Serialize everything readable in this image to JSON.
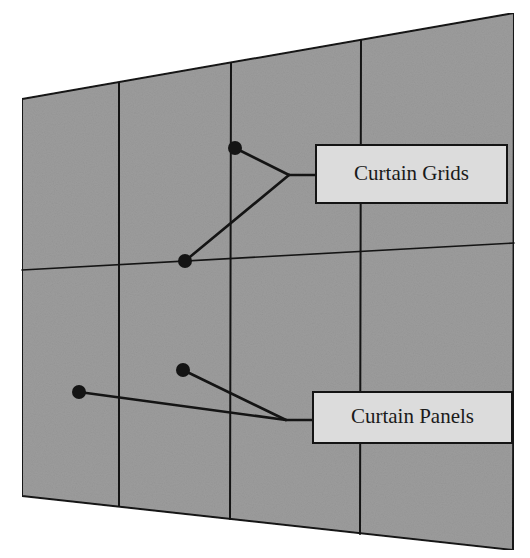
{
  "diagram": {
    "colors": {
      "wall_fill": "#9c9c9c",
      "line": "#141414",
      "label_fill": "#dcdcdc",
      "background": "#ffffff"
    },
    "wall": {
      "corners": {
        "top_left": [
          22,
          99
        ],
        "top_right": [
          514,
          13
        ],
        "bottom_right": [
          513,
          550
        ],
        "bottom_left": [
          22,
          496
        ]
      },
      "vertical_grids": [
        {
          "top": [
            119,
            83
          ],
          "bottom": [
            119,
            506
          ]
        },
        {
          "top": [
            231,
            63
          ],
          "bottom": [
            230,
            519
          ]
        },
        {
          "top": [
            361,
            40
          ],
          "bottom": [
            360,
            534
          ]
        }
      ],
      "horizontal_grids": [
        {
          "left": [
            22,
            270
          ],
          "right": [
            514,
            243
          ]
        }
      ]
    },
    "callouts": [
      {
        "label": "Curtain Grids",
        "box": {
          "x": 316,
          "y": 145,
          "w": 191,
          "h": 58
        },
        "points": [
          [
            235,
            148
          ],
          [
            185,
            261
          ]
        ],
        "join": [
          289,
          175
        ],
        "anchor": [
          316,
          175
        ]
      },
      {
        "label": "Curtain Panels",
        "box": {
          "x": 313,
          "y": 392,
          "w": 199,
          "h": 51
        },
        "points": [
          [
            79,
            392
          ],
          [
            183,
            370
          ]
        ],
        "join": [
          286,
          420
        ],
        "anchor": [
          313,
          420
        ]
      }
    ]
  }
}
